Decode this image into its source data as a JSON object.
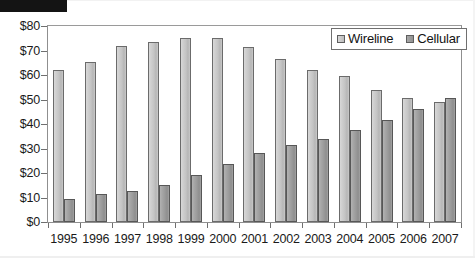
{
  "chart_data": {
    "type": "bar",
    "title": "",
    "xlabel": "",
    "ylabel": "",
    "ylim": [
      0,
      80
    ],
    "ytick_values": [
      0,
      10,
      20,
      30,
      40,
      50,
      60,
      70,
      80
    ],
    "ytick_labels": [
      "$0",
      "$10",
      "$20",
      "$30",
      "$40",
      "$50",
      "$60",
      "$70",
      "$80"
    ],
    "grid": false,
    "legend_position": "top-right",
    "categories": [
      "1995",
      "1996",
      "1997",
      "1998",
      "1999",
      "2000",
      "2001",
      "2002",
      "2003",
      "2004",
      "2005",
      "2006",
      "2007"
    ],
    "series": [
      {
        "name": "Wireline",
        "color": "#c4c4c4",
        "values": [
          62,
          65.5,
          72,
          73.5,
          75,
          75,
          71.5,
          66.5,
          62,
          59.5,
          54,
          50.5,
          49
        ]
      },
      {
        "name": "Cellular",
        "color": "#9a9a9a",
        "values": [
          9.5,
          11.5,
          12.5,
          15,
          19,
          23.5,
          28,
          31.5,
          34,
          37.5,
          41.5,
          46,
          50.5
        ]
      }
    ]
  },
  "legend": {
    "items": [
      {
        "label": "Wireline",
        "swatch": "wireline"
      },
      {
        "label": "Cellular",
        "swatch": "cellular"
      }
    ]
  },
  "redaction": {
    "present": true,
    "color": "#141414"
  }
}
